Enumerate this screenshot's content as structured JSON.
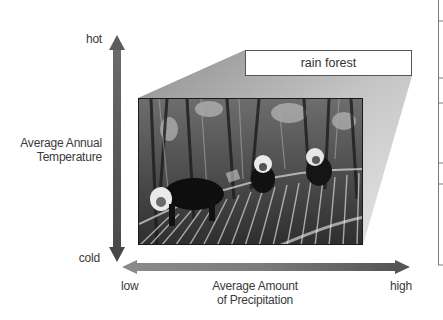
{
  "diagram": {
    "type": "climate-biome-axes",
    "y_axis": {
      "title_line1": "Average Annual",
      "title_line2": "Temperature",
      "top_label": "hot",
      "bottom_label": "cold"
    },
    "x_axis": {
      "title_line1": "Average Amount",
      "title_line2": "of Precipitation",
      "left_label": "low",
      "right_label": "high"
    },
    "callout": {
      "label": "rain forest"
    },
    "photo": {
      "description": "grayscale photo of white-faced capuchin monkeys among rain forest palm fronds"
    }
  },
  "colors": {
    "arrow": "#5a5a5a",
    "arrow_light": "#9a9a9a",
    "wedge": "#b5b5b5",
    "text": "#3a3a3a",
    "frame": "#777777"
  }
}
